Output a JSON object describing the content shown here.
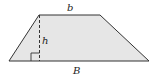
{
  "figure": {
    "shape": "trapezoid",
    "fill_color": "#e6e6e6",
    "stroke_color": "#333333",
    "labels": {
      "top_base": "b",
      "height": "h",
      "bottom_base": "B"
    },
    "annotations": [
      "dashed height line",
      "right-angle marker"
    ]
  }
}
